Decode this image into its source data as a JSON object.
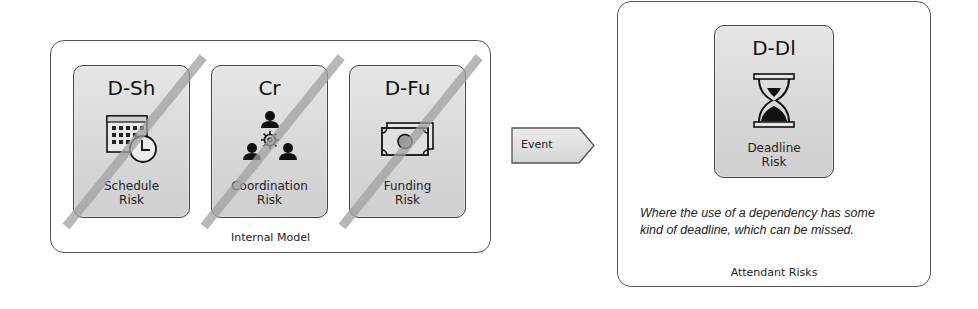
{
  "internal_model": {
    "label": "Internal Model",
    "cards": [
      {
        "code": "D-Sh",
        "name_line1": "Schedule",
        "name_line2": "Risk",
        "icon": "calendar-clock-icon",
        "struck_out": true
      },
      {
        "code": "Cr",
        "name_line1": "Coordination",
        "name_line2": "Risk",
        "icon": "people-coordination-icon",
        "struck_out": true
      },
      {
        "code": "D-Fu",
        "name_line1": "Funding",
        "name_line2": "Risk",
        "icon": "banknote-icon",
        "struck_out": true
      }
    ]
  },
  "event": {
    "label": "Event",
    "shape": "pentagon-arrow"
  },
  "attendant_risks": {
    "label": "Attendant Risks",
    "card": {
      "code": "D-Dl",
      "name_line1": "Deadline",
      "name_line2": "Risk",
      "icon": "hourglass-icon"
    },
    "description": "Where the use of a dependency has some kind of deadline, which can be missed."
  },
  "colors": {
    "card_fill": "#d8d8d8",
    "border": "#444444",
    "strike": "#a0a0a0",
    "text": "#1a1a1a"
  }
}
